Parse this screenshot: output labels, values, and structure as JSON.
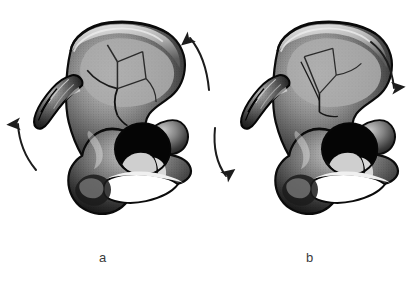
{
  "figure": {
    "type": "anatomical-illustration",
    "background_color": "#ffffff",
    "rendering": "grayscale halftone line drawing",
    "width": 417,
    "height": 281
  },
  "panels": [
    {
      "id": "a",
      "label": "a",
      "label_x": 105,
      "label_y": 258,
      "description": "Left hemipelvis with iliac wing fracture lines; arrows indicate external rotation",
      "bone_color_dark": "#1a1a1a",
      "bone_color_mid": "#7d7d7d",
      "bone_color_light": "#d8d8d8",
      "arrows": [
        {
          "name": "arrow-a-left",
          "direction": "up",
          "placement": "left of anterior iliac spines",
          "color": "#1c1c1c"
        },
        {
          "name": "arrow-a-right",
          "direction": "up",
          "placement": "right of posterior iliac crest",
          "color": "#1c1c1c"
        }
      ]
    },
    {
      "id": "b",
      "label": "b",
      "label_x": 312,
      "label_y": 258,
      "description": "Left hemipelvis with iliac wing fracture lines; arrows indicate internal rotation",
      "bone_color_dark": "#1a1a1a",
      "bone_color_mid": "#7d7d7d",
      "bone_color_light": "#d8d8d8",
      "arrows": [
        {
          "name": "arrow-b-left",
          "direction": "down",
          "placement": "left of anterior iliac spines",
          "color": "#1c1c1c"
        },
        {
          "name": "arrow-b-right",
          "direction": "down",
          "placement": "right of posterior iliac crest",
          "color": "#1c1c1c"
        }
      ]
    }
  ],
  "labels": {
    "a": "a",
    "b": "b"
  }
}
